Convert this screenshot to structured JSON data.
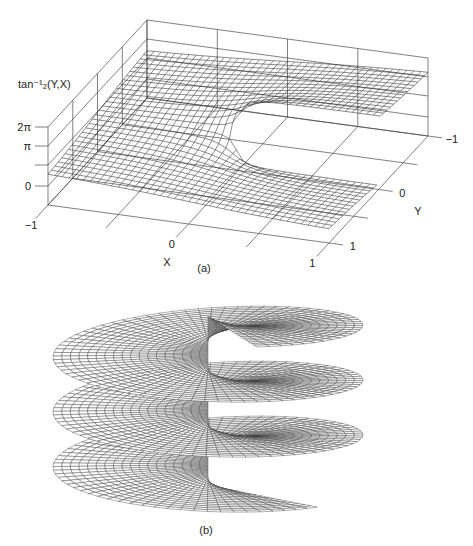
{
  "chart_data": [
    {
      "type": "surface",
      "panel_label": "(a)",
      "function": "atan2",
      "value_range": "[0, 2π)",
      "zlabel": "tan⁻¹₂(Y,X)",
      "xlabel": "X",
      "ylabel": "Y",
      "xlim": [
        -1,
        1
      ],
      "ylim": [
        -1,
        1
      ],
      "x_ticks": [
        {
          "value": -1,
          "label": "−1"
        },
        {
          "value": 0,
          "label": "0"
        },
        {
          "value": 1,
          "label": "1"
        }
      ],
      "y_ticks": [
        {
          "value": -1,
          "label": "−1"
        },
        {
          "value": 0,
          "label": "0"
        },
        {
          "value": 1,
          "label": "1"
        }
      ],
      "z_ticks": [
        {
          "label": "0"
        },
        {
          "label": ""
        },
        {
          "label": "π"
        },
        {
          "label": "2π"
        }
      ],
      "grid": true,
      "box": true,
      "mesh": {
        "nx": 40,
        "ny": 29
      },
      "branch_cut": "Y = 0, X > 0"
    },
    {
      "type": "surface",
      "panel_label": "(b)",
      "function": "helicoid",
      "turns": 3,
      "theta_range": [
        -1.25,
        18.06
      ],
      "radius_range": [
        0,
        1
      ],
      "mesh": {
        "rings": 18,
        "spokes_per_turn": 72
      },
      "axes": false
    }
  ]
}
